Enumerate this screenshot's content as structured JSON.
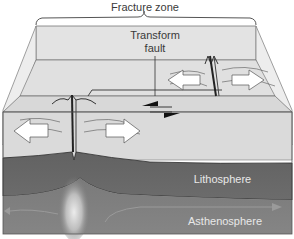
{
  "diagram": {
    "type": "block-diagram",
    "labels": {
      "fracture_zone": "Fracture zone",
      "transform_fault_line1": "Transform",
      "transform_fault_line2": "fault",
      "lithosphere": "Lithosphere",
      "asthenosphere": "Asthenosphere"
    },
    "arrows": {
      "spreading": [
        "white-double-arrow-left-ridge-left",
        "white-double-arrow-left-ridge-right",
        "white-double-arrow-right-ridge-left",
        "white-double-arrow-right-ridge-right"
      ],
      "fault_motion": [
        "black-half-arrow-left",
        "black-half-arrow-right"
      ],
      "convection": [
        "asthenosphere-flow-arrow-left",
        "asthenosphere-flow-arrow-right"
      ]
    },
    "colors": {
      "background": "#ffffff",
      "surface_top": "#e6e6e6",
      "surface_face": "#d9d9d9",
      "lithosphere": "#6e6e6e",
      "asthenosphere": "#7c7c7c",
      "magma_glow": "#e0e0e0",
      "outline": "#3a3a3a",
      "label_dark": "#3a3a3a",
      "label_light": "#e8e8e8"
    }
  }
}
